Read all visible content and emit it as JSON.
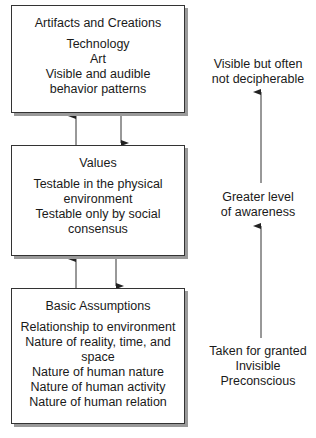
{
  "boxes": [
    {
      "title": "Artifacts and Creations",
      "lines": [
        "Technology",
        "Art",
        "Visible and audible",
        "behavior patterns"
      ]
    },
    {
      "title": "Values",
      "lines": [
        "Testable in the physical",
        "environment",
        "Testable only by social",
        "consensus"
      ]
    },
    {
      "title": "Basic Assumptions",
      "lines": [
        "Relationship to environment",
        "Nature of reality, time, and",
        "space",
        "Nature of human nature",
        "Nature of human activity",
        "Nature of human relation"
      ]
    }
  ],
  "side_labels": [
    {
      "lines": [
        "Visible but often",
        "not decipherable"
      ]
    },
    {
      "lines": [
        "Greater level",
        "of awareness"
      ]
    },
    {
      "lines": [
        "Taken for granted",
        "Invisible",
        "Preconscious"
      ]
    }
  ]
}
